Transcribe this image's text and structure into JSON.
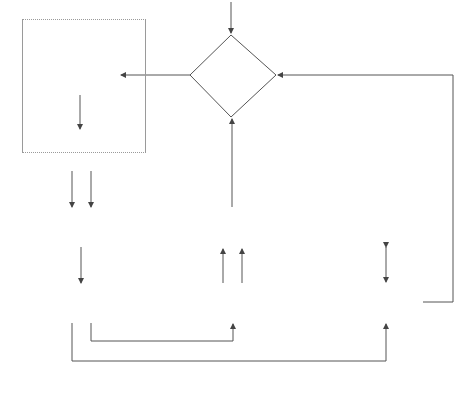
{
  "diagram": {
    "groups": {
      "frontend": {
        "title": "System Frontend"
      },
      "compiler": {
        "title": "Compiler Backend"
      },
      "interpreter": {
        "title": "Interpreter Backend"
      }
    },
    "nodes": {
      "web": {
        "line1": "Web",
        "line2": "interface"
      },
      "parser": {
        "line1": "Parser"
      },
      "class_analysis": {
        "line1": "Class",
        "line2": "analysis"
      },
      "scope_analysis": {
        "line1": "Scope",
        "line2": "analysis"
      },
      "type_checking": {
        "line1": "Type",
        "line2": "checking"
      },
      "macro_expansion": {
        "line1": "Macro",
        "line2": "expansion"
      },
      "code_generation": {
        "line1": "Code",
        "line2": "generation"
      },
      "program_inverter": {
        "line1": "Program",
        "line2": "inverter"
      },
      "jit_interpreter": {
        "line1": "JIT inverting",
        "line2": "Interpreter"
      }
    },
    "edge_labels": {
      "roopl": "ROOPL",
      "json_output": "JSON program output",
      "pisa_instructions": "PISA\ninstructions",
      "unscoped_ast_1": "Unscoped\nAST",
      "class_lookup": "Class\nlookup",
      "unscoped_ast_2": "Unscoped\nAST",
      "scoped_ast_1": "Scoped\nAST",
      "register_mapping": "Register\nmapping",
      "pisa_template": "PISA\ntemplate",
      "scoped_ast_compiler": "Scoped AST",
      "scoped_ast_interpreter": "Scoped AST"
    }
  }
}
